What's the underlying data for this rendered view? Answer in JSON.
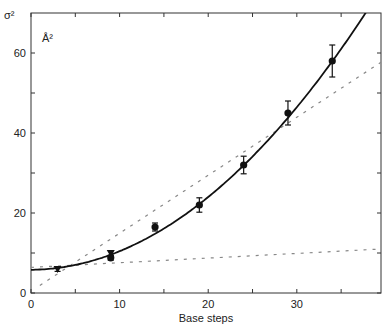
{
  "chart_data": {
    "type": "scatter",
    "title": "",
    "xlabel": "Base steps",
    "ylabel": "σ²",
    "unit_label": "Å²",
    "xlim": [
      0,
      39.5
    ],
    "ylim": [
      0,
      70
    ],
    "xticks": [
      0,
      10,
      20,
      30
    ],
    "yticks": [
      0,
      20,
      40,
      60
    ],
    "grid": false,
    "series": [
      {
        "name": "measured",
        "style": "markers with error bars",
        "points": [
          {
            "x": 3,
            "y": 6.0,
            "err": 0.6,
            "marker": "triangle-down"
          },
          {
            "x": 9,
            "y": 10.0,
            "err": 0.6,
            "marker": "triangle-down"
          },
          {
            "x": 9,
            "y": 8.8,
            "err": 0.6,
            "marker": "circle"
          },
          {
            "x": 14,
            "y": 16.5,
            "err": 1.0,
            "marker": "circle"
          },
          {
            "x": 19,
            "y": 22.0,
            "err": 1.8,
            "marker": "circle"
          },
          {
            "x": 24,
            "y": 32.0,
            "err": 2.2,
            "marker": "circle"
          },
          {
            "x": 29,
            "y": 45.0,
            "err": 3.0,
            "marker": "circle"
          },
          {
            "x": 34,
            "y": 58.0,
            "err": 4.0,
            "marker": "circle"
          }
        ]
      },
      {
        "name": "quadratic fit",
        "style": "solid",
        "formula": "y = 5.8 + 0.02x + 0.0445x^2"
      },
      {
        "name": "linear (steep)",
        "style": "dashed",
        "x": [
          1,
          39.5
        ],
        "y": [
          1.9,
          57.7
        ]
      },
      {
        "name": "linear (shallow)",
        "style": "dashed",
        "x": [
          0,
          39.5
        ],
        "y": [
          6.4,
          11.0
        ]
      }
    ]
  }
}
